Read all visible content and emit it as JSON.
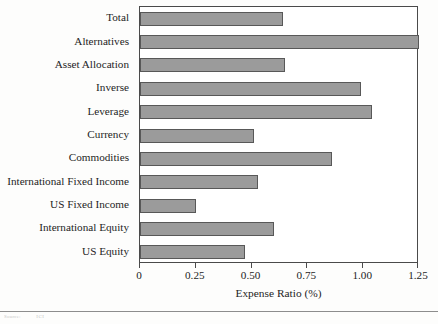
{
  "chart_data": {
    "type": "bar",
    "orientation": "horizontal",
    "title": "",
    "xlabel": "Expense Ratio (%)",
    "ylabel": "",
    "xlim": [
      0,
      1.25
    ],
    "xticks": [
      "0",
      "0.25",
      "0.50",
      "0.75",
      "1.00",
      "1.25"
    ],
    "xtick_values": [
      0,
      0.25,
      0.5,
      0.75,
      1.0,
      1.25
    ],
    "grid": false,
    "legend": null,
    "categories": [
      "Total",
      "Alternatives",
      "Asset Allocation",
      "Inverse",
      "Leverage",
      "Currency",
      "Commodities",
      "International Fixed Income",
      "US Fixed Income",
      "International Equity",
      "US Equity"
    ],
    "values": [
      0.64,
      1.25,
      0.65,
      0.99,
      1.04,
      0.51,
      0.86,
      0.53,
      0.25,
      0.6,
      0.47
    ],
    "bar_color": "#9b9b9b",
    "bar_edge_color": "#585858",
    "frame_color": "#4a4a4a",
    "background": "#ffffff"
  },
  "footer": {
    "source_label": "Source:",
    "source_value": "ICI"
  }
}
